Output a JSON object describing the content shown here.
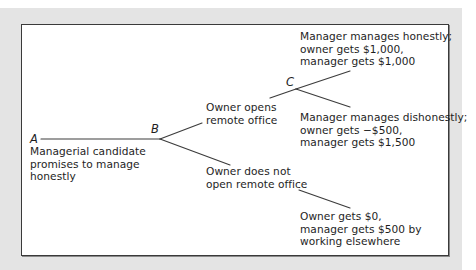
{
  "diagram": {
    "type": "game-tree",
    "nodes": {
      "a": "A",
      "b": "B",
      "c": "C"
    },
    "labels": {
      "root": [
        "Managerial candidate",
        "promises to manage",
        "honestly"
      ],
      "open_office": [
        "Owner opens",
        "remote office"
      ],
      "no_office": [
        "Owner does not",
        "open remote office"
      ],
      "honest_outcome": [
        "Manager manages honestly;",
        "owner gets $1,000,",
        "manager gets $1,000"
      ],
      "dishonest_outcome": [
        "Manager manages dishonestly;",
        "owner gets −$500,",
        "manager gets $1,500"
      ],
      "no_office_outcome": [
        "Owner gets $0,",
        "manager gets $500 by",
        "working elsewhere"
      ]
    },
    "colors": {
      "frame": "#e4e4e4",
      "box_border": "#3a3a3a",
      "line": "#3c3c3c",
      "text": "#1e1e1e"
    }
  }
}
